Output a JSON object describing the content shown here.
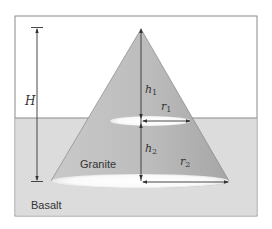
{
  "figure": {
    "labels": {
      "H": "H",
      "h1": "h",
      "h1_sub": "1",
      "h2": "h",
      "h2_sub": "2",
      "r1": "r",
      "r1_sub": "1",
      "r2": "r",
      "r2_sub": "2",
      "granite": "Granite",
      "basalt": "Basalt"
    },
    "colors": {
      "frame": "#8a8a8a",
      "basalt_fill": "#dcdcdc",
      "cone_fill": "#bdbdbd",
      "cone_shadow": "#a9a9a9",
      "ellipse_fill": "#ffffff",
      "line": "#333333"
    }
  }
}
